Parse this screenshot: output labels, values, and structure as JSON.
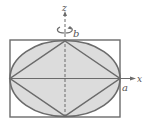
{
  "figure": {
    "labels": {
      "z_axis": "z",
      "x_axis": "x",
      "semi_axis_vertical": "b",
      "semi_axis_horizontal": "a"
    },
    "shapes": [
      "bounding-rectangle",
      "ellipse",
      "inscribed-rhombus"
    ],
    "rotation_axis": "z",
    "colors": {
      "fill": "#d9d9d9",
      "stroke": "#6b6b6b",
      "background": "#ffffff"
    }
  }
}
